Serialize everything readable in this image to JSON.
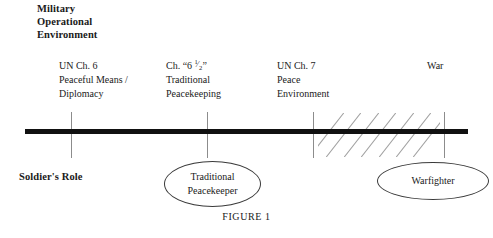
{
  "figure": {
    "caption": "FIGURE 1",
    "axis_title_lines": [
      "Military",
      "Operational",
      "Environment"
    ],
    "role_title": "Soldier's Role"
  },
  "stages": [
    {
      "id": "un-ch-6",
      "lines": [
        "UN Ch. 6",
        "Peaceful Means /",
        "Diplomacy"
      ],
      "has_fraction": false,
      "label_left": 59,
      "label_top": 59,
      "tick_x": 71
    },
    {
      "id": "ch-6-and-a-half",
      "prefix": "Ch. “6 ",
      "fraction_numerator": "1",
      "fraction_bar": "⁄",
      "fraction_denominator": "2",
      "suffix": "”",
      "lines": [
        "Ch. “6 1/2”",
        "Traditional",
        "Peacekeeping"
      ],
      "has_fraction": true,
      "label_left": 166,
      "label_top": 59,
      "tick_x": 207
    },
    {
      "id": "un-ch-7",
      "lines": [
        "UN Ch. 7",
        "Peace",
        "Environment"
      ],
      "has_fraction": false,
      "label_left": 277,
      "label_top": 59,
      "tick_x": 313
    },
    {
      "id": "war",
      "lines": [
        "War"
      ],
      "has_fraction": false,
      "label_left": 427,
      "label_top": 59,
      "tick_x": 444
    }
  ],
  "roles": [
    {
      "id": "traditional-peacekeeper",
      "lines": [
        "Traditional",
        "Peacekeeper"
      ]
    },
    {
      "id": "warfighter",
      "lines": [
        "Warfighter"
      ]
    }
  ],
  "hatching": {
    "count": 7,
    "start_x": 318,
    "end_x": 440,
    "angle_deg": 38,
    "color": "#a0a0a0"
  },
  "colors": {
    "axis": "#111111",
    "tick": "#8c8c8c",
    "text": "#1a1a1a",
    "ellipse_border": "#3a3a3a",
    "background": "#ffffff"
  }
}
